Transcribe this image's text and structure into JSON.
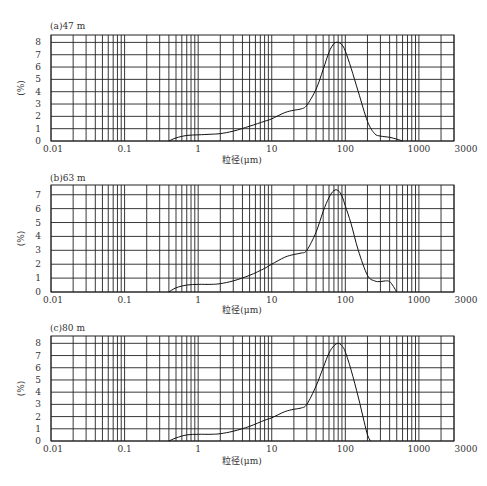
{
  "caption": "图1 粒度分布曲线",
  "chart_data": [
    {
      "type": "line",
      "title": "(a)47 m",
      "xlabel": "粒径(μm)",
      "ylabel": "(%)",
      "xscale": "log",
      "xlim": [
        0.01,
        3000
      ],
      "ylim": [
        0,
        8.6
      ],
      "xticks": [
        "0.01",
        "0.1",
        "1",
        "10",
        "100",
        "1000",
        "3000"
      ],
      "yticks": [
        "0",
        "1",
        "2",
        "3",
        "4",
        "5",
        "6",
        "7",
        "8"
      ],
      "grid": true,
      "x": [
        0.4,
        0.5,
        0.7,
        1.0,
        1.5,
        2,
        3,
        5,
        8,
        10,
        15,
        20,
        25,
        30,
        40,
        50,
        60,
        70,
        80,
        90,
        100,
        120,
        150,
        200,
        250,
        300,
        400,
        500,
        600
      ],
      "values": [
        0,
        0.25,
        0.45,
        0.5,
        0.55,
        0.6,
        0.8,
        1.2,
        1.6,
        1.8,
        2.3,
        2.5,
        2.6,
        2.9,
        4.2,
        5.8,
        7.2,
        7.9,
        8.0,
        7.8,
        7.3,
        5.9,
        4.0,
        1.6,
        0.6,
        0.4,
        0.3,
        0.15,
        0
      ]
    },
    {
      "type": "line",
      "title": "(b)63 m",
      "xlabel": "粒径(μm)",
      "ylabel": "(%)",
      "xscale": "log",
      "xlim": [
        0.01,
        3000
      ],
      "ylim": [
        0,
        7.7
      ],
      "xticks": [
        "0.01",
        "0.1",
        "1",
        "10",
        "100",
        "1000",
        "3000"
      ],
      "yticks": [
        "0",
        "1",
        "2",
        "3",
        "4",
        "5",
        "6",
        "7"
      ],
      "grid": true,
      "x": [
        0.4,
        0.5,
        0.7,
        1.0,
        1.5,
        2,
        3,
        5,
        8,
        10,
        15,
        20,
        25,
        30,
        40,
        50,
        60,
        70,
        80,
        90,
        100,
        120,
        150,
        200,
        250,
        300,
        350,
        400,
        450,
        500
      ],
      "values": [
        0,
        0.3,
        0.5,
        0.55,
        0.55,
        0.6,
        0.8,
        1.2,
        1.7,
        2.0,
        2.5,
        2.7,
        2.8,
        3.0,
        4.3,
        5.8,
        6.8,
        7.3,
        7.3,
        6.9,
        6.2,
        4.9,
        3.0,
        1.2,
        0.8,
        0.75,
        0.8,
        0.75,
        0.4,
        0
      ]
    },
    {
      "type": "line",
      "title": "(c)80 m",
      "xlabel": "粒径(μm)",
      "ylabel": "(%)",
      "xscale": "log",
      "xlim": [
        0.01,
        3000
      ],
      "ylim": [
        0,
        8.6
      ],
      "xticks": [
        "0.01",
        "0.1",
        "1",
        "10",
        "100",
        "1000",
        "3000"
      ],
      "yticks": [
        "0",
        "1",
        "2",
        "3",
        "4",
        "5",
        "6",
        "7",
        "8"
      ],
      "grid": true,
      "x": [
        0.4,
        0.5,
        0.7,
        1.0,
        1.5,
        2,
        3,
        5,
        8,
        10,
        15,
        20,
        25,
        30,
        40,
        50,
        60,
        70,
        80,
        90,
        100,
        120,
        150,
        180,
        200,
        220
      ],
      "values": [
        0,
        0.25,
        0.5,
        0.55,
        0.55,
        0.6,
        0.8,
        1.2,
        1.7,
        1.9,
        2.4,
        2.6,
        2.7,
        3.0,
        4.5,
        6.0,
        7.2,
        7.8,
        8.0,
        7.8,
        7.3,
        5.8,
        3.6,
        1.6,
        0.5,
        0
      ]
    }
  ]
}
